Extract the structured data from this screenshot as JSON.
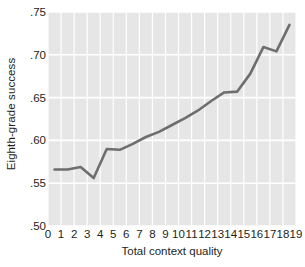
{
  "chart_data": {
    "type": "line",
    "title": "",
    "xlabel": "Total context quality",
    "ylabel": "Eighth-grade success",
    "xlim": [
      0,
      19
    ],
    "ylim": [
      0.5,
      0.75
    ],
    "grid": true,
    "legend": "none",
    "background_color": "#e6e6e6",
    "gridline_color": "#ffffff",
    "line_color": "#6e6e6e",
    "line_width": 2.6,
    "x_tick_labels": [
      "0",
      "1",
      "2",
      "3",
      "4",
      "5",
      "6",
      "7",
      "8",
      "9",
      "10",
      "11",
      "12",
      "13",
      "14",
      "15",
      "16",
      "17",
      "18",
      "19"
    ],
    "x_tick_values": [
      0,
      1,
      2,
      3,
      4,
      5,
      6,
      7,
      8,
      9,
      10,
      11,
      12,
      13,
      14,
      15,
      16,
      17,
      18,
      19
    ],
    "y_tick_labels": [
      ".50",
      ".55",
      ".60",
      ".65",
      ".70",
      ".75"
    ],
    "y_tick_values": [
      0.5,
      0.55,
      0.6,
      0.65,
      0.7,
      0.75
    ],
    "x": [
      0.5,
      1.5,
      2.5,
      3.5,
      4.5,
      5.5,
      6.5,
      7.5,
      8.5,
      9.5,
      10.5,
      11.5,
      12.5,
      13.5,
      14.5,
      15.5,
      16.5,
      17.5,
      18.5
    ],
    "values": [
      0.566,
      0.566,
      0.569,
      0.556,
      0.59,
      0.589,
      0.596,
      0.604,
      0.61,
      0.618,
      0.626,
      0.635,
      0.646,
      0.656,
      0.657,
      0.678,
      0.709,
      0.704,
      0.735
    ],
    "series": [
      {
        "name": "Eighth-grade success",
        "values": [
          0.566,
          0.566,
          0.569,
          0.556,
          0.59,
          0.589,
          0.596,
          0.604,
          0.61,
          0.618,
          0.626,
          0.635,
          0.646,
          0.656,
          0.657,
          0.678,
          0.709,
          0.704,
          0.735
        ]
      }
    ]
  }
}
